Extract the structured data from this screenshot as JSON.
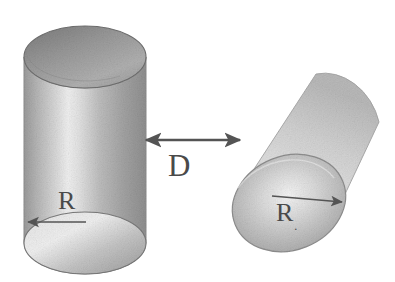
{
  "figure": {
    "background_color": "#ffffff",
    "ink_color": "#4a4a4a",
    "width": 395,
    "height": 282,
    "caption_labels": {
      "separation": "D",
      "radius_left": "R",
      "radius_right": "R",
      "radius_right_subscript": "."
    },
    "objects": {
      "left_cylinder": {
        "name": "upright-cylinder",
        "orientation": "vertical",
        "top_face": "ellipse",
        "shading": "gray-gradient"
      },
      "right_cylinder": {
        "name": "tilted-cylinder",
        "orientation": "tilted",
        "near_face": "ellipse",
        "shading": "light-gray-gradient"
      }
    },
    "annotations": [
      {
        "name": "separation-dimension",
        "label": "D",
        "arrow": "double-headed",
        "from": "left-cylinder-right-edge",
        "to": "right-cylinder-left-edge"
      },
      {
        "name": "left-radius-dimension",
        "label": "R",
        "arrow": "single-headed-left",
        "on": "left-cylinder-bottom-ellipse"
      },
      {
        "name": "right-radius-dimension",
        "label": "R",
        "arrow": "single-headed-right",
        "on": "right-cylinder-near-ellipse"
      }
    ]
  }
}
